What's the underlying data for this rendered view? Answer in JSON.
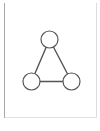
{
  "panel": {
    "background_color": "#ffffff",
    "left_rule_color": "#a8a8a8",
    "right_rule_color": "#dcdcdc",
    "bottom_rule_color": "#e2e2e2"
  },
  "diagram": {
    "name": "triangle-node-link-graph",
    "stroke_color": "#555555",
    "node_fill": "#ffffff",
    "node_stroke_width": 1.2,
    "edge_stroke_width": 1.4,
    "node_radius": 8.5,
    "nodes": [
      {
        "id": "top",
        "label": "",
        "cx": 49.5,
        "cy": 39.5
      },
      {
        "id": "bottom-left",
        "label": "",
        "cx": 31.5,
        "cy": 81.5
      },
      {
        "id": "bottom-right",
        "label": "",
        "cx": 71.5,
        "cy": 81.5
      }
    ],
    "edges": [
      {
        "id": "top-to-bottom-left",
        "from": "top",
        "to": "bottom-left"
      },
      {
        "id": "top-to-bottom-right",
        "from": "top",
        "to": "bottom-right"
      },
      {
        "id": "bottom-left-to-bottom-right",
        "from": "bottom-left",
        "to": "bottom-right"
      }
    ]
  }
}
